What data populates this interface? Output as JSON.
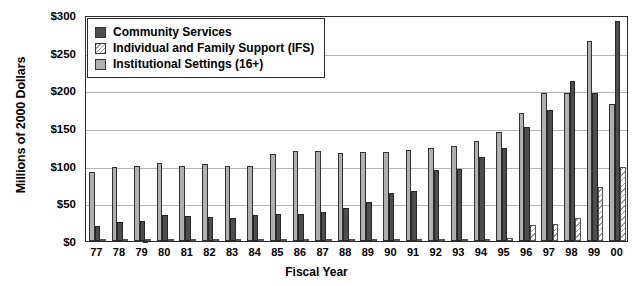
{
  "chart_data": {
    "type": "bar",
    "title": "",
    "xlabel": "Fiscal Year",
    "ylabel": "Millions of 2000 Dollars",
    "ylim": [
      0,
      300
    ],
    "yticks": [
      "$0",
      "$50",
      "$100",
      "$150",
      "$200",
      "$250",
      "$300"
    ],
    "ytick_values": [
      0,
      50,
      100,
      150,
      200,
      250,
      300
    ],
    "grid": true,
    "legend_position": "top-left",
    "categories": [
      "77",
      "78",
      "79",
      "80",
      "81",
      "82",
      "83",
      "84",
      "85",
      "86",
      "87",
      "88",
      "89",
      "90",
      "91",
      "92",
      "93",
      "94",
      "95",
      "96",
      "97",
      "98",
      "99",
      "00"
    ],
    "series": [
      {
        "name": "Institutional Settings (16+)",
        "color": "#b0b0b0",
        "values": [
          92,
          98,
          99,
          104,
          100,
          102,
          99,
          100,
          115,
          119,
          119,
          117,
          118,
          118,
          121,
          123,
          126,
          133,
          145,
          170,
          196,
          197,
          266,
          182
        ]
      },
      {
        "name": "Community Services",
        "color": "#4d4d4d",
        "values": [
          20,
          25,
          27,
          35,
          33,
          32,
          30,
          34,
          36,
          36,
          38,
          44,
          52,
          64,
          66,
          94,
          96,
          111,
          124,
          152,
          174,
          212,
          196,
          292
        ]
      },
      {
        "name": "Individual and Family Support (IFS)",
        "color": "#ffffff",
        "values": [
          2,
          2,
          2,
          2,
          2,
          2,
          2,
          2,
          2,
          2,
          2,
          2,
          2,
          2,
          2,
          2,
          2,
          3,
          4,
          21,
          22,
          30,
          72,
          98
        ]
      }
    ]
  },
  "legend": {
    "items": [
      {
        "label": "Community Services",
        "swatch": "comm"
      },
      {
        "label": "Individual and Family Support (IFS)",
        "swatch": "ifs"
      },
      {
        "label": "Institutional Settings (16+)",
        "swatch": "inst"
      }
    ]
  }
}
